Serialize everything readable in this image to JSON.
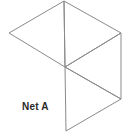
{
  "diagram": {
    "title": "Net A",
    "type": "net of triangles",
    "line_color": "#8a8a8a",
    "vertices": {
      "top": [
        64,
        1
      ],
      "left": [
        9,
        33
      ],
      "center": [
        65,
        67
      ],
      "right_top": [
        121,
        33
      ],
      "right_bottom": [
        121,
        99
      ],
      "bottom": [
        66,
        131
      ]
    },
    "triangles": [
      {
        "name": "left-triangle",
        "points": "64,1 9,33 65,67"
      },
      {
        "name": "upper-right-triangle",
        "points": "64,1 121,33 65,67"
      },
      {
        "name": "middle-right-triangle",
        "points": "65,67 121,33 121,99"
      },
      {
        "name": "bottom-triangle",
        "points": "65,67 121,99 66,131"
      }
    ]
  }
}
